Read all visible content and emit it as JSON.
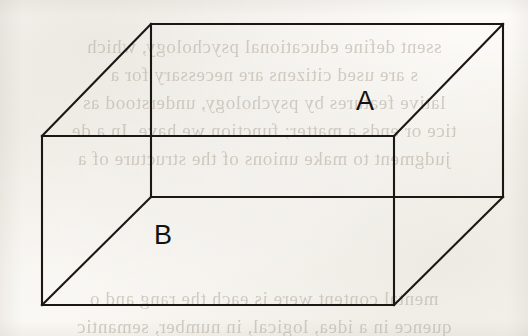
{
  "figure": {
    "type": "line-drawing",
    "stroke_color": "#1a1714",
    "background_color": "#fbfaf7",
    "labels": [
      {
        "id": "A",
        "text": "A",
        "face": "top-face"
      },
      {
        "id": "B",
        "text": "B",
        "face": "front-face"
      }
    ],
    "geometry": {
      "front_face": {
        "left": 42,
        "right": 394,
        "top": 136,
        "bottom": 305
      },
      "back_face": {
        "left": 151,
        "right": 503,
        "top": 24,
        "bottom": 197
      },
      "depth_offset_x": 109,
      "depth_offset_y": -112
    },
    "vertices": {
      "front_top_left": [
        42,
        136
      ],
      "front_top_right": [
        394,
        136
      ],
      "front_bottom_left": [
        42,
        305
      ],
      "front_bottom_right": [
        394,
        305
      ],
      "back_top_left": [
        151,
        24
      ],
      "back_top_right": [
        503,
        24
      ],
      "back_bottom_left": [
        151,
        197
      ],
      "back_bottom_right": [
        503,
        197
      ]
    }
  },
  "bleed_through": {
    "note": "faint mirrored text showing through from the reverse side of the scanned page",
    "lines": [
      {
        "top": 36,
        "text": "ssent define educational psychology, which"
      },
      {
        "top": 64,
        "text": "s are used citizens are necessary for a"
      },
      {
        "top": 92,
        "text": "lative features by psychology, understood as"
      },
      {
        "top": 120,
        "text": "tice or ends a matter; function we have. In a de"
      },
      {
        "top": 148,
        "text": "judgment to make unions of the structure of a"
      },
      {
        "top": 288,
        "text": "mental content were is each the rang and o"
      },
      {
        "top": 316,
        "text": "quence in a idea, logical, in number, semantic"
      }
    ]
  }
}
